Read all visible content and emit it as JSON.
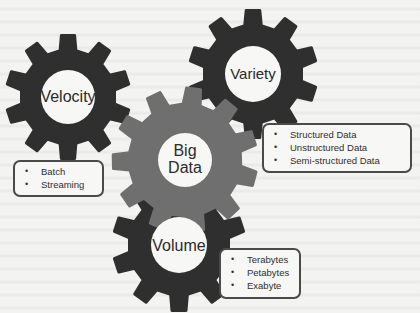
{
  "diagram": {
    "colors": {
      "dark_gear": "#2f2f2f",
      "center_gear": "#6f6f6f",
      "hub": "#f7f7f5",
      "box_border": "#4a4a4a",
      "text": "#2b2b2b"
    },
    "gears": [
      {
        "id": "velocity",
        "label": "Velocity",
        "teeth": 10,
        "color_key": "dark_gear"
      },
      {
        "id": "variety",
        "label": "Variety",
        "teeth": 10,
        "color_key": "dark_gear"
      },
      {
        "id": "big-data",
        "label_line1": "Big",
        "label_line2": "Data",
        "teeth": 11,
        "color_key": "center_gear"
      },
      {
        "id": "volume",
        "label": "Volume",
        "teeth": 10,
        "color_key": "dark_gear"
      }
    ],
    "boxes": {
      "velocity": {
        "bullet": "•",
        "items": [
          "Batch",
          "Streaming"
        ]
      },
      "variety": {
        "bullet": "•",
        "items": [
          "Structured Data",
          "Unstructured Data",
          "Semi-structured Data"
        ]
      },
      "volume": {
        "bullet": "•",
        "items": [
          "Terabytes",
          "Petabytes",
          "Exabyte"
        ]
      }
    }
  }
}
